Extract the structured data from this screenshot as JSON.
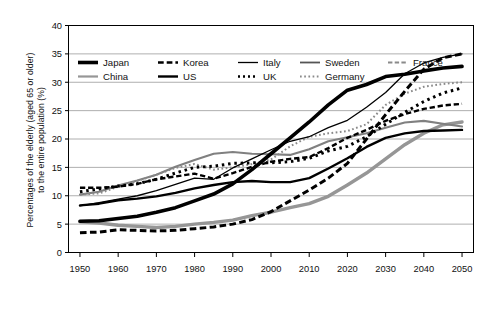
{
  "chart_data": {
    "type": "line",
    "title": "",
    "xlabel": "",
    "ylabel_line1": "Percentages of the elderly (aged 65 or older)",
    "ylabel_line2": "to the entire population (%)",
    "xlim": [
      1947,
      2053
    ],
    "ylim": [
      0,
      40
    ],
    "x_ticks": [
      1950,
      1960,
      1970,
      1980,
      1990,
      2000,
      2010,
      2020,
      2030,
      2040,
      2050
    ],
    "y_ticks": [
      0,
      5,
      10,
      15,
      20,
      25,
      30,
      35,
      40
    ],
    "grid": "horizontal",
    "legend_position": "upper-left-inside",
    "x": [
      1950,
      1955,
      1960,
      1965,
      1970,
      1975,
      1980,
      1985,
      1990,
      1995,
      2000,
      2005,
      2010,
      2015,
      2020,
      2025,
      2030,
      2035,
      2040,
      2045,
      2050
    ],
    "series": [
      {
        "name": "Japan",
        "style": "solid",
        "color": "#000000",
        "width": 3.6,
        "values": [
          5.5,
          5.6,
          6.0,
          6.4,
          7.1,
          7.9,
          9.1,
          10.3,
          12.1,
          14.6,
          17.4,
          20.2,
          23.0,
          26.0,
          28.6,
          29.6,
          31.0,
          31.4,
          32.0,
          32.5,
          32.8
        ]
      },
      {
        "name": "China",
        "style": "solid",
        "color": "#969696",
        "width": 3.4,
        "values": [
          5.4,
          5.2,
          4.8,
          4.6,
          4.4,
          4.6,
          5.0,
          5.3,
          5.7,
          6.5,
          7.1,
          7.9,
          8.6,
          9.9,
          11.9,
          14.0,
          16.5,
          19.0,
          21.0,
          22.5,
          23.0
        ]
      },
      {
        "name": "Korea",
        "style": "dashed",
        "color": "#000000",
        "width": 3.0,
        "values": [
          3.5,
          3.6,
          4.0,
          3.9,
          3.8,
          3.9,
          4.2,
          4.5,
          5.0,
          5.8,
          7.2,
          9.1,
          11.0,
          13.1,
          15.7,
          20.0,
          24.3,
          28.4,
          32.3,
          34.3,
          35.0
        ]
      },
      {
        "name": "US",
        "style": "solid",
        "color": "#000000",
        "width": 2.4,
        "values": [
          8.3,
          8.6,
          9.2,
          9.5,
          9.9,
          10.5,
          11.3,
          11.9,
          12.4,
          12.6,
          12.4,
          12.4,
          13.1,
          14.8,
          16.6,
          18.6,
          20.2,
          21.0,
          21.4,
          21.5,
          21.6
        ]
      },
      {
        "name": "Italy",
        "style": "solid",
        "color": "#000000",
        "width": 1.3,
        "values": [
          8.2,
          8.8,
          9.4,
          10.0,
          10.9,
          12.0,
          13.1,
          12.9,
          14.9,
          16.5,
          18.1,
          19.6,
          20.4,
          22.0,
          23.3,
          25.6,
          28.2,
          31.5,
          33.4,
          34.4,
          35.0
        ]
      },
      {
        "name": "UK",
        "style": "dotted",
        "color": "#000000",
        "width": 3.0,
        "values": [
          10.7,
          11.2,
          11.7,
          12.1,
          12.9,
          14.0,
          15.0,
          15.2,
          15.7,
          15.8,
          15.8,
          16.0,
          16.6,
          17.9,
          18.7,
          20.4,
          22.6,
          24.7,
          26.6,
          28.1,
          29.0
        ]
      },
      {
        "name": "Sweden",
        "style": "solid",
        "color": "#808080",
        "width": 2.1,
        "values": [
          10.2,
          10.7,
          11.8,
          12.7,
          13.7,
          15.1,
          16.3,
          17.4,
          17.7,
          17.4,
          17.3,
          17.2,
          18.2,
          19.6,
          20.3,
          21.0,
          22.0,
          22.9,
          23.2,
          22.7,
          22.2
        ]
      },
      {
        "name": "Germany",
        "style": "dotted",
        "color": "#8a8a8a",
        "width": 2.0,
        "values": [
          10.2,
          10.4,
          11.6,
          12.6,
          13.7,
          14.9,
          15.6,
          14.6,
          15.0,
          15.6,
          16.4,
          18.7,
          20.4,
          21.0,
          21.4,
          22.6,
          26.0,
          28.0,
          29.2,
          29.7,
          30.0
        ]
      },
      {
        "name": "France",
        "style": "dashed",
        "color": "#000000",
        "width": 2.4,
        "values": [
          11.4,
          11.4,
          11.6,
          12.1,
          12.9,
          13.4,
          13.9,
          13.0,
          14.0,
          15.1,
          16.0,
          16.5,
          16.8,
          18.4,
          20.2,
          21.6,
          23.2,
          24.4,
          25.3,
          25.9,
          26.2
        ]
      }
    ],
    "legend": [
      {
        "label": "Japan",
        "style": "solid",
        "color": "#000000",
        "width": 3.6
      },
      {
        "label": "Korea",
        "style": "dashed",
        "color": "#000000",
        "width": 2.6
      },
      {
        "label": "Italy",
        "style": "solid",
        "color": "#000000",
        "width": 1.3
      },
      {
        "label": "Sweden",
        "style": "solid",
        "color": "#555555",
        "width": 1.8
      },
      {
        "label": "France",
        "style": "dashed",
        "color": "#8a8a8a",
        "width": 2.0
      },
      {
        "label": "China",
        "style": "solid",
        "color": "#969696",
        "width": 2.2
      },
      {
        "label": "US",
        "style": "solid",
        "color": "#000000",
        "width": 2.4
      },
      {
        "label": "UK",
        "style": "dotted",
        "color": "#000000",
        "width": 2.4
      },
      {
        "label": "Germany",
        "style": "dotted",
        "color": "#8a8a8a",
        "width": 2.0
      },
      {
        "label": "",
        "style": "none",
        "color": "#ffffff",
        "width": 0
      }
    ]
  }
}
